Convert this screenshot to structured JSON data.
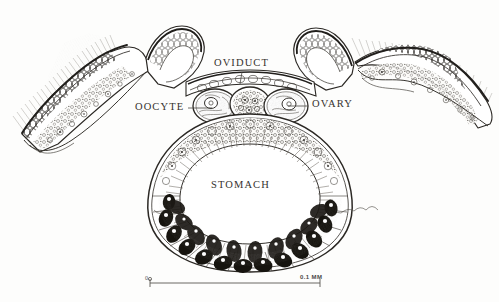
{
  "figure": {
    "style": "pen-and-ink stipple scientific illustration",
    "background_color": "#fdfdfc",
    "ink_color": "#2b2824"
  },
  "labels": {
    "oviduct": "OVIDUCT",
    "oocyte": "OOCYTE",
    "ovary": "OVARY",
    "stomach": "STOMACH"
  },
  "scale_bar": {
    "left_value": "0",
    "right_value": "0.1 MM",
    "left_x": 150,
    "right_x": 320,
    "y": 283
  },
  "structures": {
    "left_arm": "ciliated corona arm extending upper-left",
    "right_arm": "ciliated corona arm extending upper-right",
    "stomach_lumen": "central oval cavity lined with radiating cilia",
    "pigmented_cells": "ring of dark gastric gland cells around lower stomach",
    "ovary_cells": "three rounded germinal cells below oviduct"
  }
}
